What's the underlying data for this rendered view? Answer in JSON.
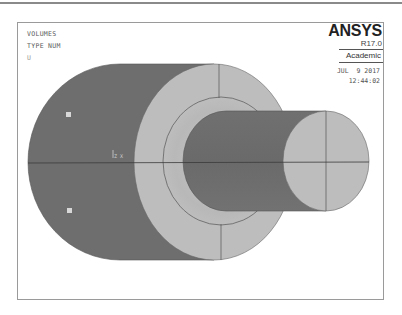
{
  "window": {
    "product": "ANSYS",
    "version": "R17.0",
    "license": "Academic",
    "date": "JUL  9 2017",
    "time": "12:44:02"
  },
  "plot_labels": {
    "title": "VOLUMES",
    "subtitle": "TYPE NUM",
    "extra": "U"
  },
  "triad": {
    "label": "Z X"
  },
  "colors": {
    "background": "#ffffff",
    "frame": "#9a9a9a",
    "cylinder_body_dark": "#6e6e6e",
    "end_face_light": "#bdbdbd",
    "edge_lines": "#444444"
  },
  "volumes": [
    {
      "name": "outer-cylinder",
      "shade": "dark"
    },
    {
      "name": "outer-end-face",
      "shade": "light"
    },
    {
      "name": "inner-shaft",
      "shade": "dark"
    },
    {
      "name": "shaft-end-face",
      "shade": "light"
    }
  ]
}
